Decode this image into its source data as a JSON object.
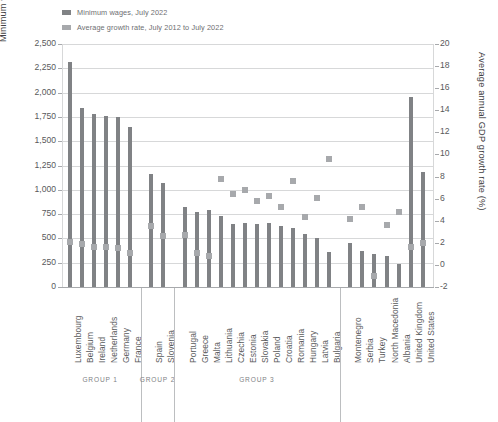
{
  "legend": {
    "items": [
      {
        "label": "Minimum wages, July 2022",
        "color": "#808285",
        "name": "legend-minimum-wages"
      },
      {
        "label": "Average growth rate, July 2012 to July 2022",
        "color": "#a7a9ac",
        "name": "legend-growth-rate"
      }
    ]
  },
  "chart_data": {
    "type": "bar",
    "title": "",
    "xlabel": "",
    "ylabel": "Minimum wages (€ per month)",
    "y2label": "Average annual GDP growth rate (%)",
    "ylim": [
      0,
      2500
    ],
    "y2lim": [
      -2,
      20
    ],
    "yticks": [
      "0",
      "250",
      "500",
      "750",
      "1,000",
      "1,250",
      "1,500",
      "1,750",
      "2,000",
      "2,250",
      "2,500"
    ],
    "y2ticks": [
      "-2",
      "0",
      "2",
      "4",
      "6",
      "8",
      "10",
      "12",
      "14",
      "16",
      "18",
      "20"
    ],
    "grid": true,
    "legend_position": "top-left",
    "categories": [
      "Luxembourg",
      "Belgium",
      "Ireland",
      "Netherlands",
      "Germany",
      "France",
      "Spain",
      "Slovenia",
      "Portugal",
      "Greece",
      "Malta",
      "Lithuania",
      "Czechia",
      "Estonia",
      "Slovakia",
      "Poland",
      "Croatia",
      "Romania",
      "Hungary",
      "Latvia",
      "Bulgaria",
      "Montenegro",
      "Serbia",
      "Turkey",
      "North Macedonia",
      "Albania",
      "United Kingdom",
      "United States"
    ],
    "series": [
      {
        "name": "Minimum wages, July 2022",
        "unit": "€ per month",
        "axis": "left",
        "color": "#808285",
        "values": [
          2313,
          1843,
          1775,
          1756,
          1744,
          1646,
          1167,
          1074,
          823,
          774,
          792,
          730,
          652,
          654,
          646,
          655,
          624,
          606,
          542,
          500,
          363,
          450,
          370,
          338,
          318,
          232,
          1950,
          1180
        ]
      },
      {
        "name": "Average growth rate, July 2012 to July 2022",
        "unit": "%",
        "axis": "right",
        "color": "#a7a9ac",
        "values": [
          2.1,
          1.9,
          1.6,
          1.6,
          1.5,
          1.1,
          3.5,
          2.6,
          2.7,
          1.1,
          0.8,
          7.8,
          6.4,
          6.8,
          5.8,
          6.2,
          5.2,
          7.6,
          4.3,
          6.1,
          9.6,
          4.2,
          5.2,
          -1.0,
          3.6,
          4.8,
          1.6,
          2.0
        ]
      }
    ],
    "groups": [
      {
        "label": "GROUP 1",
        "start": 0,
        "end": 5
      },
      {
        "label": "GROUP 2",
        "start": 6,
        "end": 7
      },
      {
        "label": "GROUP 3",
        "start": 8,
        "end": 20
      },
      {
        "label": "",
        "start": 21,
        "end": 27
      }
    ]
  }
}
